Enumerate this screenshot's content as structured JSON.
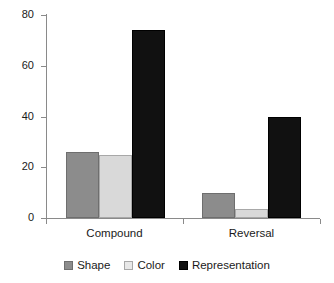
{
  "chart_data": {
    "type": "bar",
    "title": "",
    "xlabel": "",
    "ylabel": "",
    "categories": [
      "Compound",
      "Reversal"
    ],
    "series": [
      {
        "name": "Shape",
        "values": [
          26,
          10
        ],
        "color": "#8c8c8c"
      },
      {
        "name": "Color",
        "values": [
          25,
          3.5
        ],
        "color": "#d9d9d9"
      },
      {
        "name": "Representation",
        "values": [
          74,
          40
        ],
        "color": "#111111"
      }
    ],
    "ylim": [
      0,
      80
    ],
    "yticks": [
      0,
      20,
      40,
      60,
      80
    ],
    "ytick_labels": [
      "0",
      "20",
      "40",
      "60",
      "80"
    ],
    "grid": false,
    "legend_position": "bottom-center"
  },
  "axis": {
    "y_labels": [
      "80",
      "60",
      "40",
      "20",
      "0"
    ]
  },
  "xaxis": {
    "labels": [
      "Compound",
      "Reversal"
    ]
  },
  "legend": {
    "items": [
      {
        "label": "Shape"
      },
      {
        "label": "Color"
      },
      {
        "label": "Representation"
      }
    ]
  }
}
